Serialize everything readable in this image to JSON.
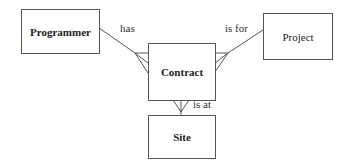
{
  "diagram": {
    "type": "entity-relationship",
    "entities": [
      {
        "id": "programmer",
        "label": "Programmer"
      },
      {
        "id": "contract",
        "label": "Contract"
      },
      {
        "id": "project",
        "label": "Project"
      },
      {
        "id": "site",
        "label": "Site"
      }
    ],
    "relationships": [
      {
        "from": "programmer",
        "to": "contract",
        "label": "has",
        "cardinality": "one-to-many"
      },
      {
        "from": "project",
        "to": "contract",
        "label": "is for",
        "cardinality": "one-to-many"
      },
      {
        "from": "site",
        "to": "contract",
        "label": "is at",
        "cardinality": "one-to-many"
      }
    ]
  },
  "colors": {
    "line": "#555555",
    "text": "#222222",
    "background": "#ffffff"
  }
}
